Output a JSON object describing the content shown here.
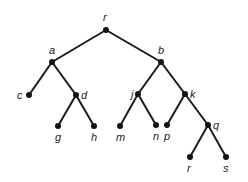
{
  "diagram": {
    "type": "rooted-tree",
    "colors": {
      "edge": "#1a1a1a",
      "node": "#111111",
      "label": "#222222",
      "background": "#ffffff"
    },
    "nodes": [
      {
        "id": "r",
        "label": "r",
        "x": 106,
        "y": 30,
        "lx": 103,
        "ly": 21
      },
      {
        "id": "a",
        "label": "a",
        "x": 52,
        "y": 62,
        "lx": 49,
        "ly": 54
      },
      {
        "id": "b",
        "label": "b",
        "x": 161,
        "y": 62,
        "lx": 158,
        "ly": 54
      },
      {
        "id": "c",
        "label": "c",
        "x": 29,
        "y": 95,
        "lx": 17,
        "ly": 99
      },
      {
        "id": "d",
        "label": "d",
        "x": 76,
        "y": 95,
        "lx": 81,
        "ly": 99
      },
      {
        "id": "j",
        "label": "j",
        "x": 138,
        "y": 94,
        "lx": 131,
        "ly": 98
      },
      {
        "id": "k",
        "label": "k",
        "x": 185,
        "y": 94,
        "lx": 190,
        "ly": 98
      },
      {
        "id": "g",
        "label": "g",
        "x": 58,
        "y": 126,
        "lx": 55,
        "ly": 141
      },
      {
        "id": "h",
        "label": "h",
        "x": 94,
        "y": 126,
        "lx": 91,
        "ly": 141
      },
      {
        "id": "m",
        "label": "m",
        "x": 120,
        "y": 126,
        "lx": 116,
        "ly": 141
      },
      {
        "id": "n",
        "label": "n",
        "x": 156,
        "y": 125,
        "lx": 153,
        "ly": 140
      },
      {
        "id": "p",
        "label": "p",
        "x": 167,
        "y": 125,
        "lx": 164,
        "ly": 140
      },
      {
        "id": "q",
        "label": "q",
        "x": 208,
        "y": 125,
        "lx": 213,
        "ly": 129
      },
      {
        "id": "r2",
        "label": "r",
        "x": 190,
        "y": 157,
        "lx": 187,
        "ly": 172
      },
      {
        "id": "s",
        "label": "s",
        "x": 226,
        "y": 157,
        "lx": 223,
        "ly": 172
      }
    ],
    "edges": [
      [
        "r",
        "a"
      ],
      [
        "r",
        "b"
      ],
      [
        "a",
        "c"
      ],
      [
        "a",
        "d"
      ],
      [
        "d",
        "g"
      ],
      [
        "d",
        "h"
      ],
      [
        "b",
        "j"
      ],
      [
        "b",
        "k"
      ],
      [
        "j",
        "m"
      ],
      [
        "j",
        "n"
      ],
      [
        "k",
        "p"
      ],
      [
        "k",
        "q"
      ],
      [
        "q",
        "r2"
      ],
      [
        "q",
        "s"
      ]
    ]
  }
}
